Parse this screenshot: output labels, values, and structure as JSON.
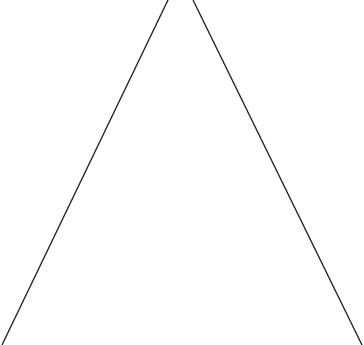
{
  "diagram": {
    "shape": "triangle-outline",
    "stroke_color": "#1a1a1a",
    "stroke_width": 1.3,
    "background": "#ffffff",
    "lines": [
      {
        "name": "left-edge",
        "x1": 168,
        "y1": 0,
        "x2": 2,
        "y2": 345
      },
      {
        "name": "right-edge",
        "x1": 193,
        "y1": 0,
        "x2": 362,
        "y2": 345
      }
    ]
  }
}
